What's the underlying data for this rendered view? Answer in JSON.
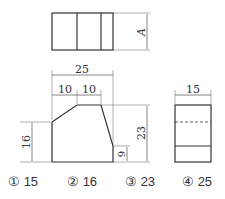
{
  "drawing": {
    "top_view_label": "A",
    "front_view": {
      "width": "25",
      "segments": [
        "10",
        "10"
      ],
      "left_height": "16",
      "total_height": "23",
      "right_height": "9"
    },
    "side_view": {
      "width": "15"
    }
  },
  "options": [
    {
      "num": "①",
      "value": "15"
    },
    {
      "num": "②",
      "value": "16"
    },
    {
      "num": "③",
      "value": "23"
    },
    {
      "num": "④",
      "value": "25"
    }
  ]
}
